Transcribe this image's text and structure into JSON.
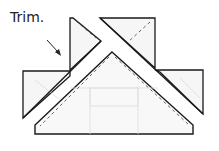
{
  "annotation": {
    "label": "Trim."
  },
  "colors": {
    "stroke": "#1a1a1a",
    "fill": "#f4f4f4",
    "faint": "#d8d8d8"
  }
}
